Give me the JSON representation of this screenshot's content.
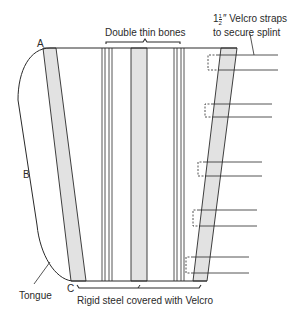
{
  "figure": {
    "title_bones": "Double thin bones",
    "strap_label_line1_whole": "1",
    "strap_label_frac_num": "1",
    "strap_label_frac_den": "2",
    "strap_label_line1_rest": "″ Velcro straps",
    "strap_label_line2": "to secure splint",
    "point_a": "A",
    "point_b": "B",
    "point_c": "C",
    "tongue_label": "Tongue",
    "bottom_label": "Rigid steel covered with Velcro"
  },
  "colors": {
    "line": "#2a2a2a",
    "shade": "#e2e2e2",
    "background": "#ffffff"
  },
  "straps": [
    {
      "y_top": 55,
      "y_bottom": 70,
      "dash_x": 208
    },
    {
      "y_top": 104,
      "y_bottom": 117,
      "dash_x": 205
    },
    {
      "y_top": 162,
      "y_bottom": 176,
      "dash_x": 198
    },
    {
      "y_top": 210,
      "y_bottom": 226,
      "dash_x": 193
    },
    {
      "y_top": 257,
      "y_bottom": 273,
      "dash_x": 186
    }
  ]
}
